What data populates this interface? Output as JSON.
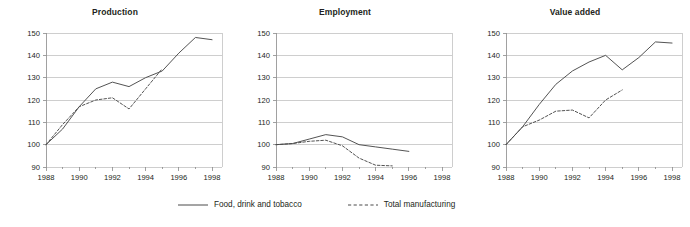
{
  "figure": {
    "background_color": "#ffffff",
    "axis_text_color": "#231f20",
    "grid_color": "#b9b9b9",
    "axis_color": "#8a8a8a"
  },
  "legend": {
    "position": "bottom-center",
    "entries": [
      {
        "label": "Food, drink and tobacco",
        "style": "solid",
        "color": "#4a4a4a",
        "icon": "solid-line-swatch"
      },
      {
        "label": "Total manufacturing",
        "style": "dashed",
        "color": "#4a4a4a",
        "icon": "dashed-line-swatch"
      }
    ]
  },
  "chart_data": [
    {
      "type": "line",
      "title": "Production",
      "xlabel": "",
      "ylabel": "",
      "xlim": [
        1988,
        1998.6
      ],
      "ylim": [
        90,
        150
      ],
      "xticks": [
        1988,
        1990,
        1992,
        1994,
        1996,
        1998
      ],
      "yticks": [
        90,
        100,
        110,
        120,
        130,
        140,
        150
      ],
      "grid": true,
      "series": [
        {
          "name": "Food, drink and tobacco",
          "style": "solid",
          "x": [
            1988,
            1989,
            1990,
            1991,
            1992,
            1993,
            1994,
            1995,
            1996,
            1997,
            1998
          ],
          "values": [
            100,
            107,
            117,
            125,
            128,
            126,
            130,
            133,
            141,
            148,
            147
          ]
        },
        {
          "name": "Total manufacturing",
          "style": "dashed",
          "x": [
            1988,
            1989,
            1990,
            1991,
            1992,
            1993,
            1994,
            1995
          ],
          "values": [
            100,
            109,
            117,
            120,
            121,
            116,
            125,
            134
          ]
        }
      ]
    },
    {
      "type": "line",
      "title": "Employment",
      "xlabel": "",
      "ylabel": "",
      "xlim": [
        1988,
        1998.6
      ],
      "ylim": [
        90,
        150
      ],
      "xticks": [
        1988,
        1990,
        1992,
        1994,
        1996,
        1998
      ],
      "yticks": [
        90,
        100,
        110,
        120,
        130,
        140,
        150
      ],
      "grid": true,
      "series": [
        {
          "name": "Food, drink and tobacco",
          "style": "solid",
          "x": [
            1988,
            1989,
            1990,
            1991,
            1992,
            1993,
            1994,
            1995,
            1996
          ],
          "values": [
            100,
            100.5,
            102.5,
            104.5,
            103.5,
            100,
            99,
            98,
            97
          ]
        },
        {
          "name": "Total manufacturing",
          "style": "dashed",
          "x": [
            1988,
            1989,
            1990,
            1991,
            1992,
            1993,
            1994,
            1995
          ],
          "values": [
            100,
            100.5,
            101.5,
            102,
            99.5,
            94,
            90.8,
            90.5
          ]
        }
      ]
    },
    {
      "type": "line",
      "title": "Value added",
      "xlabel": "",
      "ylabel": "",
      "xlim": [
        1988,
        1998.6
      ],
      "ylim": [
        90,
        150
      ],
      "xticks": [
        1988,
        1990,
        1992,
        1994,
        1996,
        1998
      ],
      "yticks": [
        90,
        100,
        110,
        120,
        130,
        140,
        150
      ],
      "grid": true,
      "series": [
        {
          "name": "Food, drink and tobacco",
          "style": "solid",
          "x": [
            1988,
            1989,
            1990,
            1991,
            1992,
            1993,
            1994,
            1995,
            1996,
            1997,
            1998
          ],
          "values": [
            100,
            108,
            118,
            127,
            133,
            137,
            140,
            133.5,
            139,
            146,
            145.5
          ]
        },
        {
          "name": "Total manufacturing",
          "style": "dashed",
          "x": [
            1988,
            1989,
            1990,
            1991,
            1992,
            1993,
            1994,
            1995
          ],
          "values": [
            100,
            108,
            111,
            115,
            115.5,
            112,
            120,
            124.5
          ]
        }
      ]
    }
  ]
}
